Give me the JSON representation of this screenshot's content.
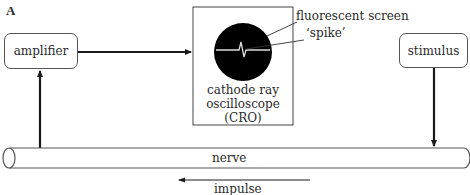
{
  "figure": {
    "panel_label": "A",
    "components": {
      "amplifier": {
        "label": "amplifier"
      },
      "stimulus": {
        "label": "stimulus"
      },
      "cro": {
        "label_line1": "cathode ray",
        "label_line2": "oscilloscope",
        "label_line3": "(CRO)"
      },
      "nerve": {
        "label": "nerve"
      }
    },
    "callouts": {
      "screen": "fluorescent screen",
      "spike": "‘spike’"
    },
    "impulse": {
      "label": "impulse",
      "direction": "right-to-left"
    },
    "colors": {
      "line": "#1a1a1a",
      "box_border": "#555555",
      "screen": "#000000",
      "trace": "#dcdcdc"
    }
  }
}
